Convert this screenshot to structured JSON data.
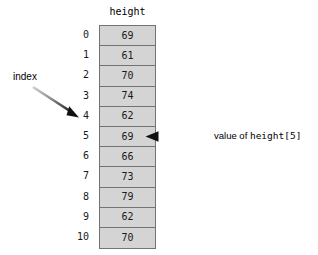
{
  "diagram": {
    "array": {
      "name_label": "height",
      "cells": [
        {
          "index": "0",
          "value": "69"
        },
        {
          "index": "1",
          "value": "61"
        },
        {
          "index": "2",
          "value": "70"
        },
        {
          "index": "3",
          "value": "74"
        },
        {
          "index": "4",
          "value": "62"
        },
        {
          "index": "5",
          "value": "69"
        },
        {
          "index": "6",
          "value": "66"
        },
        {
          "index": "7",
          "value": "73"
        },
        {
          "index": "8",
          "value": "79"
        },
        {
          "index": "9",
          "value": "62"
        },
        {
          "index": "10",
          "value": "70"
        }
      ]
    },
    "annotations": {
      "index_label": "index",
      "value_label_prefix": "value of ",
      "value_label_code": "height[5]"
    },
    "colors": {
      "cell_fill": "#d4d4d4",
      "cell_border": "#737373",
      "text": "#1a1a1a",
      "arrow_dark": "#111111",
      "arrow_light": "#c8c8c8",
      "background": "#ffffff"
    }
  }
}
